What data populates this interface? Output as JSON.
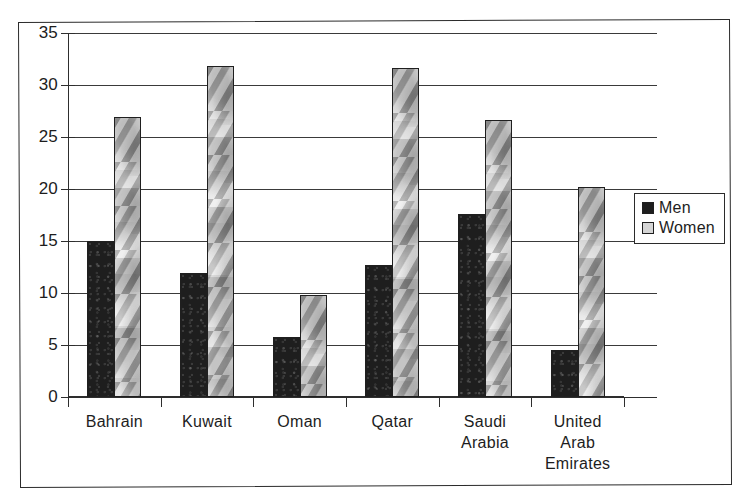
{
  "chart_data": {
    "type": "bar",
    "title": "",
    "subtitle": "",
    "xlabel": "",
    "ylabel": "",
    "ylim": [
      0,
      35
    ],
    "yticks": [
      0,
      5,
      10,
      15,
      20,
      25,
      30,
      35
    ],
    "ytick_labels": [
      "0",
      "5",
      "10",
      "15",
      "20",
      "25",
      "30",
      "35"
    ],
    "grid": true,
    "legend_position": "right",
    "categories": [
      "Bahrain",
      "Kuwait",
      "Oman",
      "Qatar",
      "Saudi Arabia",
      "United Arab Emirates"
    ],
    "category_label_lines": [
      [
        "Bahrain"
      ],
      [
        "Kuwait"
      ],
      [
        "Oman"
      ],
      [
        "Qatar"
      ],
      [
        "Saudi",
        "Arabia"
      ],
      [
        "United",
        "Arab",
        "Emirates"
      ]
    ],
    "series": [
      {
        "name": "Men",
        "color": "#1e1e1e",
        "fill": "solid-dark",
        "values": [
          15.0,
          11.9,
          5.8,
          12.7,
          17.6,
          4.5
        ]
      },
      {
        "name": "Women",
        "color": "#cfcfcf",
        "fill": "light-mottled",
        "values": [
          26.9,
          31.8,
          9.8,
          31.6,
          26.6,
          20.2
        ]
      }
    ]
  },
  "legend": {
    "entries": [
      {
        "label": "Men",
        "swatch": "men"
      },
      {
        "label": "Women",
        "swatch": "women"
      }
    ]
  },
  "colors": {
    "men_bar": "#1e1e1e",
    "women_bar": "#cfcfcf",
    "axis": "#2e2e2e",
    "grid": "#3a3a3a",
    "text": "#1d1d1d",
    "frame": "#2b2b2b",
    "background": "#ffffff"
  }
}
